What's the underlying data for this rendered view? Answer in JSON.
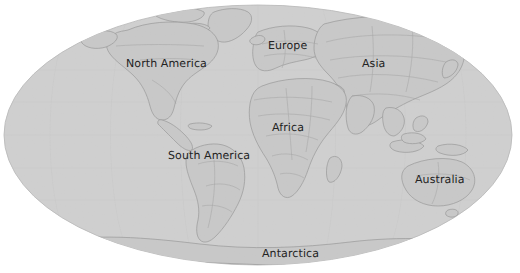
{
  "map": {
    "type": "world-map",
    "projection": "mollweide-ellipse",
    "background_color": "#ffffff",
    "ocean_color": "#cfcfcf",
    "land_color": "#c6c6c6",
    "border_color": "#9a9a9a",
    "coast_color": "#8e8e8e",
    "label_color": "#232323",
    "ellipse": {
      "cx": 258,
      "cy": 135,
      "rx": 254,
      "ry": 130
    },
    "labels": [
      {
        "name": "north-america",
        "text": "North America",
        "x": 126,
        "y": 58
      },
      {
        "name": "europe",
        "text": "Europe",
        "x": 268,
        "y": 40
      },
      {
        "name": "asia",
        "text": "Asia",
        "x": 362,
        "y": 58
      },
      {
        "name": "africa",
        "text": "Africa",
        "x": 272,
        "y": 122
      },
      {
        "name": "south-america",
        "text": "South America",
        "x": 168,
        "y": 150
      },
      {
        "name": "australia",
        "text": "Australia",
        "x": 415,
        "y": 174
      },
      {
        "name": "antarctica",
        "text": "Antarctica",
        "x": 262,
        "y": 248
      }
    ]
  }
}
